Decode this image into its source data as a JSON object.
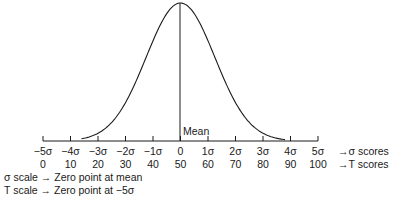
{
  "chart_data": {
    "type": "line",
    "title": "",
    "curve": {
      "name": "normal-curve",
      "mean": 0,
      "sd": 1.25,
      "x_range": [
        -3.6,
        3.8
      ]
    },
    "mean_label": "Mean",
    "sigma_ticks": [
      "−5σ",
      "−4σ",
      "−3σ",
      "−2σ",
      "−1σ",
      "0",
      "1σ",
      "2σ",
      "3σ",
      "4σ",
      "5σ"
    ],
    "sigma_values": [
      -5,
      -4,
      -3,
      -2,
      -1,
      0,
      1,
      2,
      3,
      4,
      5
    ],
    "t_ticks": [
      "0",
      "10",
      "20",
      "30",
      "40",
      "50",
      "60",
      "70",
      "80",
      "90",
      "100"
    ],
    "sigma_axis_label": "→σ  scores",
    "t_axis_label": "→T  scores",
    "xlim": [
      -5,
      5
    ]
  },
  "notes": [
    "σ scale → Zero point at mean",
    "T scale → Zero point at −5σ"
  ]
}
